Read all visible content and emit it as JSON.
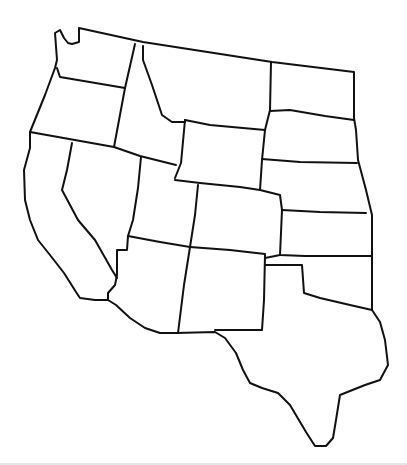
{
  "map": {
    "title": "",
    "type": "blank outline map",
    "region": "Western United States",
    "labels_visible": false,
    "stroke_color": "#111111",
    "background_color": "#ffffff",
    "states": [
      "Washington",
      "Oregon",
      "California",
      "Idaho",
      "Nevada",
      "Montana",
      "Wyoming",
      "Utah",
      "Arizona",
      "Colorado",
      "New Mexico",
      "North Dakota",
      "South Dakota",
      "Nebraska",
      "Kansas",
      "Oklahoma",
      "Texas"
    ]
  }
}
